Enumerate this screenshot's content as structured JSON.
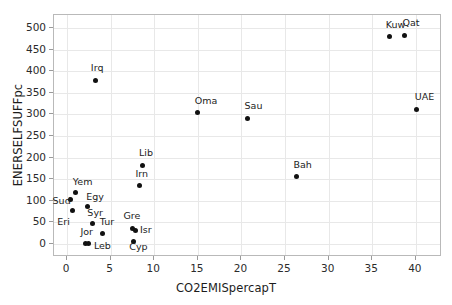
{
  "chart_data": {
    "type": "scatter",
    "title": "",
    "xlabel": "CO2EMISpercapT",
    "ylabel": "ENERSELFSUFFpc",
    "xlim": [
      -1.5,
      43.0
    ],
    "ylim": [
      -30,
      530
    ],
    "xticks": [
      0,
      5,
      10,
      15,
      20,
      25,
      30,
      35,
      40
    ],
    "yticks": [
      0,
      50,
      100,
      150,
      200,
      250,
      300,
      350,
      400,
      450,
      500
    ],
    "grid": true,
    "legend": null,
    "marker": "filled-circle",
    "marker_color": "#111111",
    "points": [
      {
        "label": "Sud",
        "x": 0.4,
        "y": 102,
        "label_dx": -18,
        "label_dy": 1
      },
      {
        "label": "Eri",
        "x": 0.6,
        "y": 77,
        "label_dx": -15,
        "label_dy": 11
      },
      {
        "label": "Yem",
        "x": 1.0,
        "y": 119,
        "label_dx": -3,
        "label_dy": -11
      },
      {
        "label": "Egy",
        "x": 2.3,
        "y": 88,
        "label_dx": -1,
        "label_dy": -9
      },
      {
        "label": "Jor",
        "x": 2.1,
        "y": 2,
        "label_dx": -5,
        "label_dy": -11
      },
      {
        "label": "Leb",
        "x": 2.5,
        "y": 2,
        "label_dx": 5,
        "label_dy": 3
      },
      {
        "label": "Syr",
        "x": 2.9,
        "y": 47,
        "label_dx": -5,
        "label_dy": -11
      },
      {
        "label": "Tur",
        "x": 4.1,
        "y": 25,
        "label_dx": -3,
        "label_dy": -11
      },
      {
        "label": "Irq",
        "x": 3.3,
        "y": 379,
        "label_dx": -5,
        "label_dy": -12
      },
      {
        "label": "Gre",
        "x": 7.5,
        "y": 36,
        "label_dx": -9,
        "label_dy": -12
      },
      {
        "label": "Isr",
        "x": 7.9,
        "y": 32,
        "label_dx": 4,
        "label_dy": 0
      },
      {
        "label": "Cyp",
        "x": 7.6,
        "y": 5,
        "label_dx": -4,
        "label_dy": 5
      },
      {
        "label": "Irn",
        "x": 8.3,
        "y": 135,
        "label_dx": -4,
        "label_dy": -12
      },
      {
        "label": "Lib",
        "x": 8.6,
        "y": 182,
        "label_dx": -3,
        "label_dy": -12
      },
      {
        "label": "Oma",
        "x": 15.0,
        "y": 304,
        "label_dx": -3,
        "label_dy": -12
      },
      {
        "label": "Sau",
        "x": 20.7,
        "y": 291,
        "label_dx": -3,
        "label_dy": -12
      },
      {
        "label": "Bah",
        "x": 26.3,
        "y": 156,
        "label_dx": -3,
        "label_dy": -12
      },
      {
        "label": "Kuw",
        "x": 37.0,
        "y": 480,
        "label_dx": -4,
        "label_dy": -12
      },
      {
        "label": "Qat",
        "x": 38.7,
        "y": 482,
        "label_dx": -2,
        "label_dy": -13
      },
      {
        "label": "UAE",
        "x": 40.1,
        "y": 311,
        "label_dx": -2,
        "label_dy": -13
      }
    ]
  }
}
